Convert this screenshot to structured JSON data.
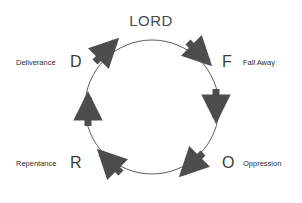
{
  "diagram": {
    "title": "LORD",
    "shape": "circle",
    "flow_direction": "clockwise",
    "circle": {
      "center_x": 152,
      "center_y": 107,
      "radius": 67,
      "stroke_color": "#5a5a5a",
      "stroke_width": 1
    },
    "arrow_color": "#4d4d4d",
    "nodes": [
      {
        "letter": "D",
        "caption": "Deliverance",
        "position": "top-left"
      },
      {
        "letter": "F",
        "caption": "Fall Away",
        "position": "top-right"
      },
      {
        "letter": "O",
        "caption": "Oppression",
        "position": "bottom-right"
      },
      {
        "letter": "R",
        "caption": "Repentance",
        "position": "bottom-left"
      }
    ],
    "arrows": [
      {
        "id": "arrow-top-left",
        "points_to": "up-right",
        "from": "D",
        "to": "LORD"
      },
      {
        "id": "arrow-top-right",
        "points_to": "down-right",
        "from": "LORD",
        "to": "F"
      },
      {
        "id": "arrow-right",
        "points_to": "down",
        "from": "F",
        "to": "O"
      },
      {
        "id": "arrow-bottom-right",
        "points_to": "down-left",
        "from": "O",
        "to": "bottom"
      },
      {
        "id": "arrow-bottom-left",
        "points_to": "up-left",
        "from": "bottom",
        "to": "R"
      },
      {
        "id": "arrow-left",
        "points_to": "up",
        "from": "R",
        "to": "D"
      }
    ]
  }
}
